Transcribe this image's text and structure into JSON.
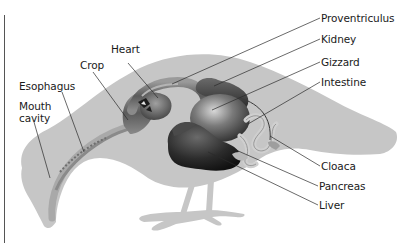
{
  "diagram": {
    "colors": {
      "silhouette": "#c6c6c6",
      "organ_dark": "#3a3a3a",
      "organ_mid": "#6e6e6e",
      "organ_light": "#a8a8a8",
      "intestine": "#d2d2d2",
      "leader_line": "#2a2a2a",
      "text": "#1a1a1a",
      "border": "#555555"
    },
    "labels": {
      "proventriculus": "Proventriculus",
      "kidney": "Kidney",
      "gizzard": "Gizzard",
      "intestine": "Intestine",
      "heart": "Heart",
      "crop": "Crop",
      "esophagus": "Esophagus",
      "mouth_cavity": "Mouth cavity",
      "cloaca": "Cloaca",
      "pancreas": "Pancreas",
      "liver": "Liver"
    }
  }
}
